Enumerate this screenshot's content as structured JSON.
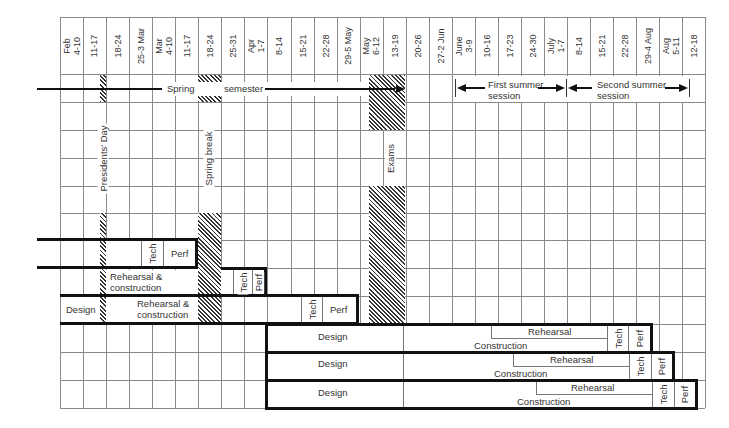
{
  "diagram": {
    "type": "production-schedule-gantt",
    "columns": [
      "Feb\n4-10",
      "11-17",
      "18-24",
      "25-3 Mar",
      "Mar\n4-10",
      "11-17",
      "18-24",
      "25-31",
      "Apr\n1-7",
      "8-14",
      "15-21",
      "22-28",
      "29-5 May",
      "May\n6-12",
      "13-19",
      "20-26",
      "27-2 Jun",
      "June\n3-9",
      "10-16",
      "17-23",
      "24-30",
      "July\n1-7",
      "8-14",
      "15-21",
      "22-28",
      "29-4 Aug",
      "Aug\n5-11",
      "12-18"
    ],
    "semester": {
      "spring_label_1": "Spring",
      "spring_label_2": "semester",
      "first_summer": "First summer\nsession",
      "second_summer": "Second summer\nsession"
    },
    "markers": {
      "presidents_day": "Presidents' Day",
      "spring_break": "Spring break",
      "exams": "Exams"
    },
    "productions": [
      {
        "id": "production-1",
        "tech": "Tech",
        "perf": "Perf"
      },
      {
        "id": "production-2",
        "phase": "Rehearsal &\nconstruction",
        "tech": "Tech",
        "perf": "Perf"
      },
      {
        "id": "production-3",
        "design": "Design",
        "phase": "Rehearsal &\nconstruction",
        "tech": "Tech",
        "perf": "Perf"
      },
      {
        "id": "production-4",
        "design": "Design",
        "rehearsal": "Rehearsal",
        "construction": "Construction",
        "tech": "Tech",
        "perf": "Perf"
      },
      {
        "id": "production-5",
        "design": "Design",
        "rehearsal": "Rehearsal",
        "construction": "Construction",
        "tech": "Tech",
        "perf": "Perf"
      },
      {
        "id": "production-6",
        "design": "Design",
        "rehearsal": "Rehearsal",
        "construction": "Construction",
        "tech": "Tech",
        "perf": "Perf"
      }
    ]
  }
}
